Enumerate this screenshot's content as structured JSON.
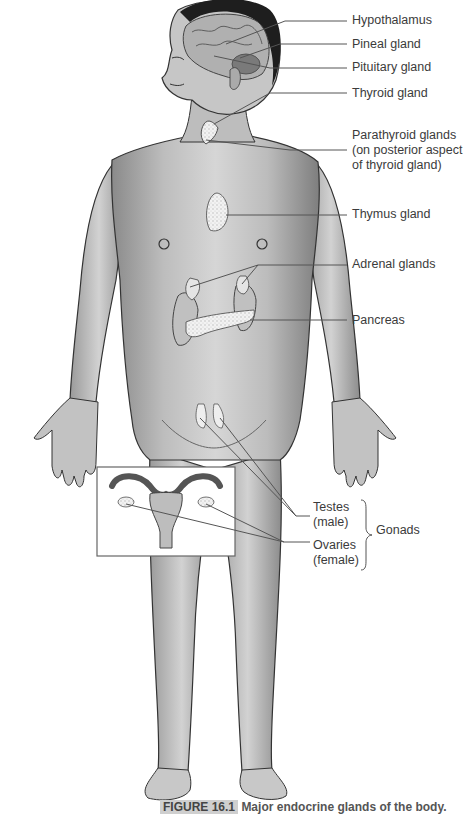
{
  "figure": {
    "title": "Major endocrine glands of the body",
    "caption_number": "FIGURE 16.1",
    "caption_text": "Major endocrine glands of the body."
  },
  "labels": [
    {
      "id": "hypothalamus",
      "text": "Hypothalamus"
    },
    {
      "id": "pineal",
      "text": "Pineal gland"
    },
    {
      "id": "pituitary",
      "text": "Pituitary gland"
    },
    {
      "id": "thyroid",
      "text": "Thyroid gland"
    },
    {
      "id": "parathyroid",
      "lines": [
        "Parathyroid glands",
        "(on posterior aspect",
        "of thyroid gland)"
      ]
    },
    {
      "id": "thymus",
      "text": "Thymus gland"
    },
    {
      "id": "adrenal",
      "text": "Adrenal glands"
    },
    {
      "id": "pancreas",
      "text": "Pancreas"
    },
    {
      "id": "testes",
      "lines": [
        "Testes",
        "(male)"
      ]
    },
    {
      "id": "ovaries",
      "lines": [
        "Ovaries",
        "(female)"
      ]
    },
    {
      "id": "gonads",
      "text": "Gonads"
    }
  ],
  "inset": {
    "description": "Female reproductive organs (uterus, fallopian tubes, ovaries)"
  },
  "colors": {
    "skin_light": "#d9d9d9",
    "skin_mid": "#a8a8a8",
    "skin_dark": "#6e6e6e",
    "hair": "#1e1e1e",
    "leader": "#555555",
    "gland_fill": "#eeeeee"
  }
}
